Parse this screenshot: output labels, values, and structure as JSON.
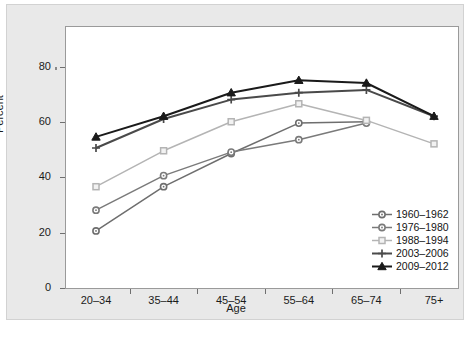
{
  "chart_data": {
    "type": "line",
    "title": "",
    "xlabel": "Age",
    "ylabel": "Percent",
    "categories": [
      "20–34",
      "35–44",
      "45–54",
      "55–64",
      "65–74",
      "75+"
    ],
    "ylim": [
      0,
      85
    ],
    "yticks": [
      0,
      20,
      40,
      60,
      80
    ],
    "ytick_labels": [
      "0",
      "20",
      "40",
      "60",
      "80"
    ],
    "grid": false,
    "legend_position": "lower-right",
    "series": [
      {
        "name": "1960–1962",
        "color": "#6e6e6e",
        "marker": "circle",
        "values": [
          21,
          37,
          49,
          60,
          60.5,
          null
        ]
      },
      {
        "name": "1976–1980",
        "color": "#7a7a7a",
        "marker": "circle",
        "values": [
          28.5,
          41,
          49.5,
          54,
          60,
          null
        ]
      },
      {
        "name": "1988–1994",
        "color": "#b4b4b4",
        "marker": "square",
        "values": [
          37,
          50,
          60.5,
          67,
          61,
          52.5
        ]
      },
      {
        "name": "2003–2006",
        "color": "#4a4a4a",
        "marker": "plus",
        "values": [
          51,
          61.5,
          68.5,
          71,
          72,
          62.5
        ]
      },
      {
        "name": "2009–2012",
        "color": "#1a1a1a",
        "marker": "triangle",
        "values": [
          55,
          62.5,
          71,
          75.5,
          74.5,
          62.5
        ]
      }
    ]
  },
  "axes": {
    "ylabel": "Percent",
    "xlabel": "Age"
  }
}
